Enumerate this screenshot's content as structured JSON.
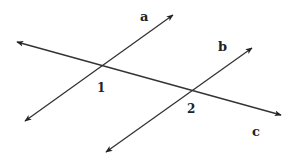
{
  "diagram": {
    "background": "#ffffff",
    "stroke_color": "#333333",
    "lines": [
      {
        "id": "a",
        "label": "a",
        "from": [
          25,
          121
        ],
        "to": [
          173,
          15
        ],
        "label_pos": [
          142,
          20
        ],
        "arrows": "both"
      },
      {
        "id": "b",
        "label": "b",
        "from": [
          106,
          152
        ],
        "to": [
          252,
          48
        ],
        "label_pos": [
          222,
          50
        ],
        "arrows": "both"
      },
      {
        "id": "c",
        "label": "c",
        "from": [
          17,
          42
        ],
        "to": [
          281,
          115
        ],
        "label_pos": [
          255,
          135
        ],
        "arrows": "both"
      }
    ],
    "angles": [
      {
        "id": "1",
        "label": "1",
        "at_intersection": [
          "a",
          "c"
        ],
        "point": [
          99,
          68
        ],
        "label_pos": [
          98,
          92
        ]
      },
      {
        "id": "2",
        "label": "2",
        "at_intersection": [
          "b",
          "c"
        ],
        "point": [
          190,
          92
        ],
        "label_pos": [
          188,
          113
        ]
      }
    ]
  }
}
